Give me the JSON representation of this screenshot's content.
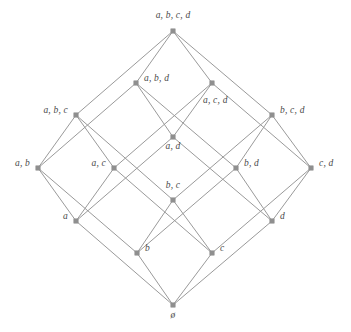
{
  "diagram": {
    "type": "hasse-lattice",
    "edge_color": "#9a9a9a",
    "node_color": "#8f8f8f",
    "label_color": "#4a4a4a",
    "background_color": "#ffffff",
    "nodes": [
      {
        "id": "abcd",
        "label": "a, b, c, d",
        "rank": 4,
        "x": 173,
        "y": 31,
        "label_x": 173,
        "label_y": 16,
        "label_anchor": "center"
      },
      {
        "id": "abd",
        "label": "a, b, d",
        "rank": 3,
        "x": 136,
        "y": 83,
        "label_x": 144,
        "label_y": 79,
        "label_anchor": "left"
      },
      {
        "id": "acd",
        "label": "a, c, d",
        "rank": 3,
        "x": 212,
        "y": 83,
        "label_x": 203,
        "label_y": 101,
        "label_anchor": "left"
      },
      {
        "id": "abc",
        "label": "a, b, c",
        "rank": 3,
        "x": 76,
        "y": 115,
        "label_x": 68,
        "label_y": 111,
        "label_anchor": "right"
      },
      {
        "id": "bcd",
        "label": "b, c, d",
        "rank": 3,
        "x": 272,
        "y": 115,
        "label_x": 280,
        "label_y": 111,
        "label_anchor": "left"
      },
      {
        "id": "ad",
        "label": "a, d",
        "rank": 2,
        "x": 173,
        "y": 137,
        "label_x": 173,
        "label_y": 147,
        "label_anchor": "center"
      },
      {
        "id": "ab",
        "label": "a, b",
        "rank": 2,
        "x": 38,
        "y": 168,
        "label_x": 30,
        "label_y": 164,
        "label_anchor": "right"
      },
      {
        "id": "ac",
        "label": "a, c",
        "rank": 2,
        "x": 114,
        "y": 168,
        "label_x": 106,
        "label_y": 164,
        "label_anchor": "right"
      },
      {
        "id": "bd",
        "label": "b, d",
        "rank": 2,
        "x": 236,
        "y": 168,
        "label_x": 244,
        "label_y": 164,
        "label_anchor": "left"
      },
      {
        "id": "cd",
        "label": "c, d",
        "rank": 2,
        "x": 311,
        "y": 168,
        "label_x": 319,
        "label_y": 164,
        "label_anchor": "left"
      },
      {
        "id": "bc",
        "label": "b, c",
        "rank": 2,
        "x": 173,
        "y": 200,
        "label_x": 173,
        "label_y": 186,
        "label_anchor": "center"
      },
      {
        "id": "a",
        "label": "a",
        "rank": 1,
        "x": 76,
        "y": 221,
        "label_x": 68,
        "label_y": 217,
        "label_anchor": "right"
      },
      {
        "id": "d",
        "label": "d",
        "rank": 1,
        "x": 272,
        "y": 221,
        "label_x": 280,
        "label_y": 217,
        "label_anchor": "left"
      },
      {
        "id": "b",
        "label": "b",
        "rank": 1,
        "x": 137,
        "y": 253,
        "label_x": 145,
        "label_y": 249,
        "label_anchor": "left"
      },
      {
        "id": "c",
        "label": "c",
        "rank": 1,
        "x": 212,
        "y": 253,
        "label_x": 220,
        "label_y": 249,
        "label_anchor": "left"
      },
      {
        "id": "empty",
        "label": "ø",
        "rank": 0,
        "x": 173,
        "y": 305,
        "label_x": 173,
        "label_y": 316,
        "label_anchor": "center"
      }
    ],
    "edges": [
      {
        "from": "abcd",
        "to": "abc"
      },
      {
        "from": "abcd",
        "to": "abd"
      },
      {
        "from": "abcd",
        "to": "acd"
      },
      {
        "from": "abcd",
        "to": "bcd"
      },
      {
        "from": "abc",
        "to": "ab"
      },
      {
        "from": "abc",
        "to": "ac"
      },
      {
        "from": "abc",
        "to": "bc"
      },
      {
        "from": "abd",
        "to": "ab"
      },
      {
        "from": "abd",
        "to": "ad"
      },
      {
        "from": "abd",
        "to": "bd"
      },
      {
        "from": "acd",
        "to": "ac"
      },
      {
        "from": "acd",
        "to": "ad"
      },
      {
        "from": "acd",
        "to": "cd"
      },
      {
        "from": "bcd",
        "to": "bc"
      },
      {
        "from": "bcd",
        "to": "bd"
      },
      {
        "from": "bcd",
        "to": "cd"
      },
      {
        "from": "ab",
        "to": "a"
      },
      {
        "from": "ab",
        "to": "b"
      },
      {
        "from": "ac",
        "to": "a"
      },
      {
        "from": "ac",
        "to": "c"
      },
      {
        "from": "ad",
        "to": "a"
      },
      {
        "from": "ad",
        "to": "d"
      },
      {
        "from": "bc",
        "to": "b"
      },
      {
        "from": "bc",
        "to": "c"
      },
      {
        "from": "bd",
        "to": "b"
      },
      {
        "from": "bd",
        "to": "d"
      },
      {
        "from": "cd",
        "to": "c"
      },
      {
        "from": "cd",
        "to": "d"
      },
      {
        "from": "a",
        "to": "empty"
      },
      {
        "from": "b",
        "to": "empty"
      },
      {
        "from": "c",
        "to": "empty"
      },
      {
        "from": "d",
        "to": "empty"
      }
    ]
  }
}
